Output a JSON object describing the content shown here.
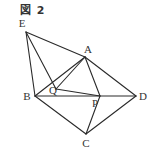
{
  "figure": {
    "title": "図 2"
  },
  "diagram": {
    "points": {
      "E": {
        "label": "E",
        "x": 26,
        "y": 32,
        "lx": 22,
        "ly": 27
      },
      "A": {
        "label": "A",
        "x": 85,
        "y": 57,
        "lx": 88,
        "ly": 53
      },
      "B": {
        "label": "B",
        "x": 35,
        "y": 96,
        "lx": 27,
        "ly": 100
      },
      "Q": {
        "label": "Q",
        "x": 56,
        "y": 89,
        "lx": 53,
        "ly": 94
      },
      "P": {
        "label": "P",
        "x": 100,
        "y": 96,
        "lx": 95,
        "ly": 107
      },
      "D": {
        "label": "D",
        "x": 136,
        "y": 96,
        "lx": 143,
        "ly": 100
      },
      "C": {
        "label": "C",
        "x": 86,
        "y": 134,
        "lx": 86,
        "ly": 147
      }
    },
    "edges": [
      [
        "E",
        "A"
      ],
      [
        "E",
        "B"
      ],
      [
        "E",
        "Q"
      ],
      [
        "A",
        "B"
      ],
      [
        "A",
        "D"
      ],
      [
        "A",
        "Q"
      ],
      [
        "A",
        "P"
      ],
      [
        "Q",
        "P"
      ],
      [
        "B",
        "D"
      ],
      [
        "B",
        "C"
      ],
      [
        "C",
        "D"
      ],
      [
        "C",
        "P"
      ]
    ],
    "line_color": "#2a2a2a"
  }
}
